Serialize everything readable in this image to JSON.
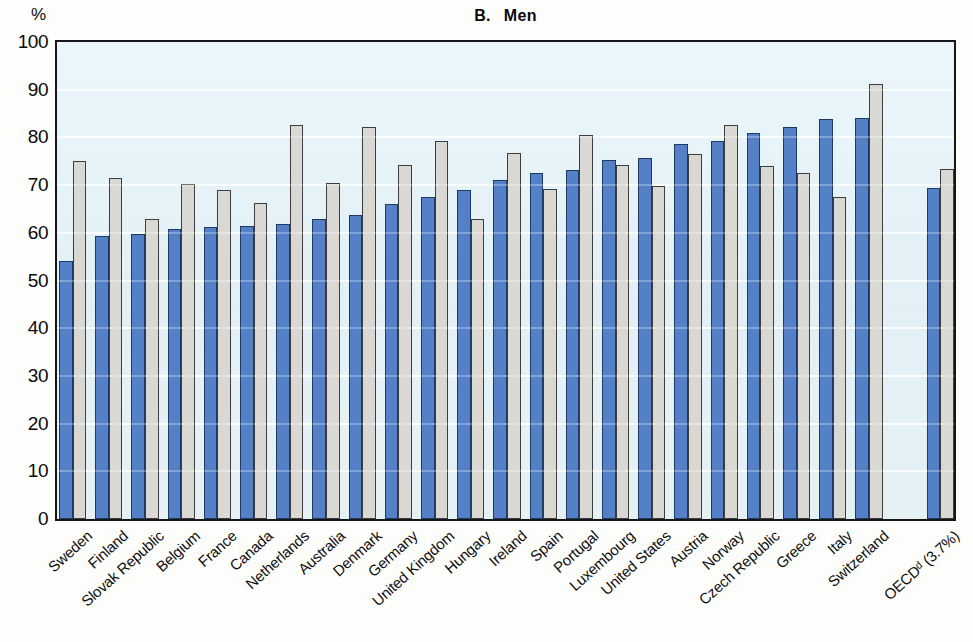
{
  "header": {
    "panel_letter": "B.",
    "panel_title": "Men"
  },
  "chart_data": {
    "type": "bar",
    "xlabel": "",
    "ylabel": "%",
    "ylim": [
      0,
      100
    ],
    "yticks": [
      0,
      10,
      20,
      30,
      40,
      50,
      60,
      70,
      80,
      90,
      100
    ],
    "grid": "horizontal white gridlines at every 10",
    "legend_position": "none",
    "plot_background": "#e4f1f6",
    "categories": [
      "Sweden",
      "Finland",
      "Slovak Republic",
      "Belgium",
      "France",
      "Canada",
      "Netherlands",
      "Australia",
      "Denmark",
      "Germany",
      "United Kingdom",
      "Hungary",
      "Ireland",
      "Spain",
      "Portugal",
      "Luxembourg",
      "United States",
      "Austria",
      "Norway",
      "Czech Republic",
      "Greece",
      "Italy",
      "Switzerland",
      "OECDᵈ (3.7%)"
    ],
    "series": [
      {
        "name": "blue",
        "color": "#5380c7",
        "border_color": "#1e3a63",
        "values": [
          54.0,
          59.3,
          59.8,
          60.9,
          61.2,
          61.4,
          61.9,
          63.0,
          63.7,
          66.1,
          67.6,
          68.9,
          71.1,
          72.6,
          73.2,
          75.2,
          75.7,
          78.6,
          79.3,
          81.0,
          82.2,
          83.8,
          84.1,
          69.4
        ]
      },
      {
        "name": "gray",
        "color": "#d9d8d3",
        "border_color": "#3d3d3d",
        "values": [
          75.1,
          71.5,
          63.0,
          70.2,
          69.0,
          66.2,
          82.7,
          70.4,
          82.1,
          74.2,
          79.3,
          62.9,
          76.8,
          69.1,
          80.6,
          74.2,
          69.8,
          76.6,
          82.7,
          74.1,
          72.5,
          67.6,
          91.2,
          73.4
        ]
      }
    ],
    "note": "extra gap before last category group"
  }
}
